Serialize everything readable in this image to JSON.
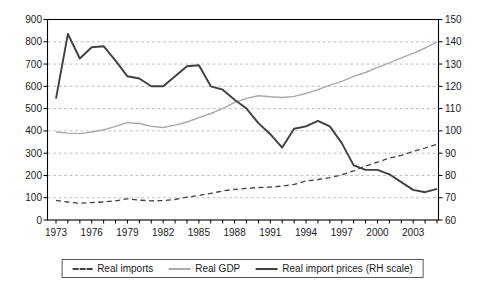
{
  "chart_data": {
    "type": "line",
    "title": "",
    "xlabel": "",
    "ylabel_left": "",
    "ylabel_right": "",
    "grid": "horizontal-dashed",
    "legend_position": "bottom-center",
    "x": [
      1973,
      1974,
      1975,
      1976,
      1977,
      1978,
      1979,
      1980,
      1981,
      1982,
      1983,
      1984,
      1985,
      1986,
      1987,
      1988,
      1989,
      1990,
      1991,
      1992,
      1993,
      1994,
      1995,
      1996,
      1997,
      1998,
      1999,
      2000,
      2001,
      2002,
      2003,
      2004,
      2005
    ],
    "x_tick_labels": [
      "1973",
      "1976",
      "1979",
      "1982",
      "1985",
      "1988",
      "1991",
      "1994",
      "1997",
      "2000",
      "2003"
    ],
    "axes": {
      "left": {
        "min": 0,
        "max": 900,
        "ticks": [
          0,
          100,
          200,
          300,
          400,
          500,
          600,
          700,
          800,
          900
        ]
      },
      "right": {
        "min": 60,
        "max": 150,
        "ticks": [
          60,
          70,
          80,
          90,
          100,
          110,
          120,
          130,
          140,
          150
        ]
      }
    },
    "series": [
      {
        "name": "Real imports",
        "axis": "left",
        "style": "dashed-dark",
        "values": [
          88,
          81,
          75,
          78,
          81,
          86,
          95,
          89,
          86,
          87,
          92,
          103,
          110,
          120,
          130,
          138,
          142,
          146,
          148,
          152,
          160,
          175,
          182,
          190,
          203,
          221,
          242,
          260,
          278,
          290,
          308,
          323,
          340
        ]
      },
      {
        "name": "Real GDP",
        "axis": "left",
        "style": "solid-gray",
        "values": [
          395,
          390,
          388,
          395,
          405,
          420,
          437,
          433,
          420,
          415,
          426,
          440,
          459,
          478,
          500,
          528,
          546,
          558,
          553,
          550,
          555,
          568,
          585,
          605,
          622,
          645,
          662,
          685,
          705,
          728,
          748,
          772,
          800
        ]
      },
      {
        "name": "Real import prices (RH scale)",
        "axis": "right",
        "style": "solid-dark",
        "values": [
          114.5,
          143.5,
          132.5,
          137.5,
          138,
          131.5,
          124.5,
          123.5,
          120,
          120,
          124.5,
          129,
          129.5,
          120,
          118.5,
          114,
          110,
          103.5,
          98.5,
          92.5,
          101,
          102,
          104.5,
          102,
          94.5,
          84.5,
          82.5,
          82.5,
          80.5,
          77,
          73.5,
          72.5,
          74
        ]
      }
    ],
    "colors": {
      "dark_line": "#404040",
      "gray_line": "#a9a9a9",
      "grid_line": "#bababa",
      "axis_line": "#000000",
      "text": "#1a1a1a",
      "background": "#ffffff"
    }
  }
}
